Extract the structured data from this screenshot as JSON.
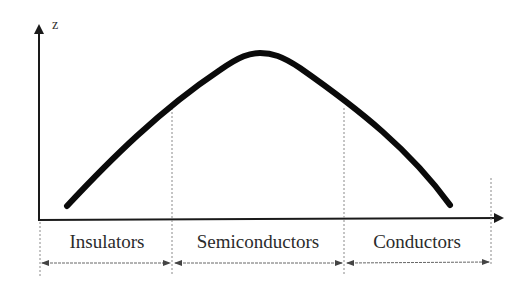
{
  "diagram": {
    "y_axis_label": "z",
    "regions": [
      {
        "label": "Insulators",
        "x_start": 39,
        "x_end": 172
      },
      {
        "label": "Semiconductors",
        "x_start": 172,
        "x_end": 344
      },
      {
        "label": "Conductors",
        "x_start": 344,
        "x_end": 491
      }
    ],
    "curve": {
      "shape": "bell-like arch",
      "start": [
        67,
        206
      ],
      "peak": [
        258,
        52
      ],
      "end": [
        450,
        205
      ]
    },
    "colors": {
      "curve": "#0a0a0a",
      "axis": "#1a1a1a",
      "dotted": "#8a8a8a",
      "text": "#2b2b2b"
    }
  }
}
